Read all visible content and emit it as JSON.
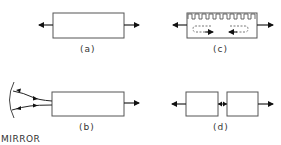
{
  "panels": {
    "a": {
      "label": "(a)"
    },
    "b": {
      "label": "(b)",
      "mirror_label": "MIRROR"
    },
    "c": {
      "label": "(c)"
    },
    "d": {
      "label": "(d)"
    }
  },
  "colors": {
    "stroke": "#444444",
    "arrow": "#111111",
    "box_fill": "#ffffff"
  }
}
